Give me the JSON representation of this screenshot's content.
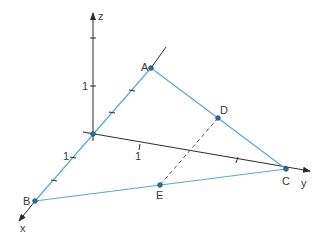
{
  "diagram": {
    "type": "3d-coordinate-geometry",
    "colors": {
      "axis": "#2b2b2b",
      "triangle": "#5aaad6",
      "point_fill": "#2f6f9a",
      "dashed": "#555555",
      "text": "#3a3a3a"
    },
    "axes": {
      "x_label": "x",
      "y_label": "y",
      "z_label": "z",
      "unit_label_x": "1",
      "unit_label_y": "1",
      "unit_label_z": "1"
    },
    "points": {
      "A": "A",
      "B": "B",
      "C": "C",
      "D": "D",
      "E": "E"
    },
    "segments": [
      {
        "from": "A",
        "to": "B",
        "style": "solid",
        "color": "triangle"
      },
      {
        "from": "A",
        "to": "C",
        "style": "solid",
        "color": "triangle"
      },
      {
        "from": "B",
        "to": "C",
        "style": "solid",
        "color": "triangle"
      },
      {
        "from": "D",
        "to": "E",
        "style": "dashed",
        "color": "dashed"
      }
    ]
  }
}
